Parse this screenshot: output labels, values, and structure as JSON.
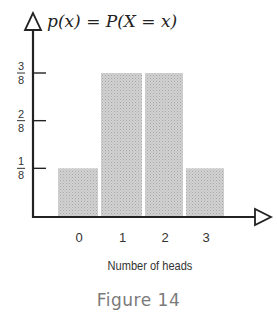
{
  "chart_data": {
    "type": "bar",
    "title": "p(x) = P(X = x)",
    "xlabel": "Number of heads",
    "ylabel": "p(x) = P(X = x)",
    "categories": [
      "0",
      "1",
      "2",
      "3"
    ],
    "values": [
      0.125,
      0.375,
      0.375,
      0.125
    ],
    "value_labels": [
      "1/8",
      "3/8",
      "3/8",
      "1/8"
    ],
    "y_ticks": [
      {
        "value": 0.125,
        "num": "1",
        "den": "8"
      },
      {
        "value": 0.25,
        "num": "2",
        "den": "8"
      },
      {
        "value": 0.375,
        "num": "3",
        "den": "8"
      }
    ],
    "ylim": [
      0,
      0.5
    ],
    "grid": false,
    "legend": null,
    "bar_color": "#c8c8c8"
  },
  "axis": {
    "y_title": "p(x) = P(X = x)",
    "x_title": "Number of heads"
  },
  "caption": "Figure 14"
}
